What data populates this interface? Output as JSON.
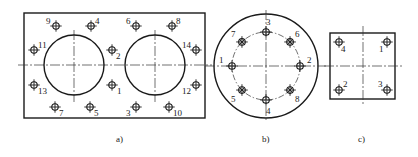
{
  "figure": {
    "panels": [
      {
        "id": "a",
        "caption": "a)",
        "shape": "rectangle",
        "bolt_sequence_labels": [
          "9",
          "4",
          "6",
          "8",
          "11",
          "2",
          "14",
          "13",
          "1",
          "12",
          "7",
          "5",
          "3",
          "10"
        ],
        "holes": [
          {
            "label": "9",
            "pos": "top-left-outer"
          },
          {
            "label": "4",
            "pos": "top-left-inner"
          },
          {
            "label": "6",
            "pos": "top-right-inner"
          },
          {
            "label": "8",
            "pos": "top-right-outer"
          },
          {
            "label": "11",
            "pos": "mid-upper-left"
          },
          {
            "label": "2",
            "pos": "mid-upper-center"
          },
          {
            "label": "14",
            "pos": "mid-upper-right"
          },
          {
            "label": "13",
            "pos": "mid-lower-left"
          },
          {
            "label": "1",
            "pos": "mid-lower-center"
          },
          {
            "label": "12",
            "pos": "mid-lower-right"
          },
          {
            "label": "7",
            "pos": "bottom-left-outer"
          },
          {
            "label": "5",
            "pos": "bottom-left-inner"
          },
          {
            "label": "3",
            "pos": "bottom-right-inner"
          },
          {
            "label": "10",
            "pos": "bottom-right-outer"
          }
        ]
      },
      {
        "id": "b",
        "caption": "b)",
        "shape": "circle",
        "holes": [
          {
            "label": "3",
            "angle_deg": 90,
            "style": "plain"
          },
          {
            "label": "6",
            "angle_deg": 45,
            "style": "crossed"
          },
          {
            "label": "2",
            "angle_deg": 0,
            "style": "plain"
          },
          {
            "label": "8",
            "angle_deg": -45,
            "style": "crossed"
          },
          {
            "label": "4",
            "angle_deg": -90,
            "style": "plain"
          },
          {
            "label": "5",
            "angle_deg": -135,
            "style": "crossed"
          },
          {
            "label": "1",
            "angle_deg": 180,
            "style": "plain"
          },
          {
            "label": "7",
            "angle_deg": 135,
            "style": "crossed"
          }
        ]
      },
      {
        "id": "c",
        "caption": "c)",
        "shape": "square",
        "holes": [
          {
            "label": "4",
            "pos": "top-left"
          },
          {
            "label": "1",
            "pos": "top-right"
          },
          {
            "label": "2",
            "pos": "bottom-left"
          },
          {
            "label": "3",
            "pos": "bottom-right"
          }
        ]
      }
    ]
  }
}
